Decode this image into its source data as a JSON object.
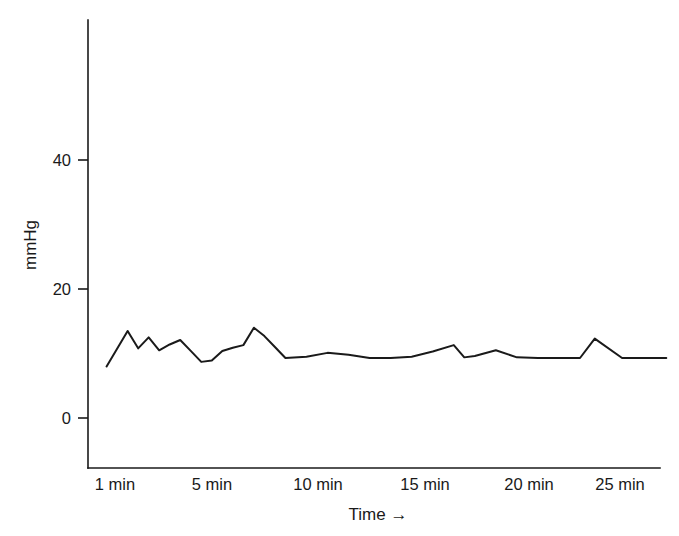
{
  "chart_data": {
    "type": "line",
    "title": "",
    "subtitle": "",
    "xlabel": "Time",
    "xlabel_display": "Time →",
    "ylabel": "mmHg",
    "grid": false,
    "legend": "none",
    "xlim": [
      0.3,
      27.5
    ],
    "ylim": [
      0,
      62
    ],
    "y_ticks": [
      0,
      20,
      40
    ],
    "y_tick_labels": [
      "0",
      "20",
      "40"
    ],
    "x_ticks": [
      1,
      5,
      10,
      15,
      20,
      25
    ],
    "x_tick_labels": [
      "1 min",
      "5 min",
      "10 min",
      "15 min",
      "20 min",
      "25 min"
    ],
    "series": [
      {
        "name": "pressure",
        "color": "#1a1a1a",
        "x": [
          0.6,
          1.6,
          2.1,
          2.6,
          3.1,
          3.6,
          4.1,
          4.6,
          5.1,
          5.6,
          6.1,
          6.6,
          7.1,
          7.6,
          8.1,
          8.6,
          9.1,
          10.1,
          11.1,
          12.1,
          13.1,
          14.1,
          15.1,
          16.1,
          17.1,
          17.6,
          18.1,
          19.1,
          20.1,
          21.1,
          22.1,
          23.1,
          23.8,
          25.1,
          26.1,
          27.2
        ],
        "y": [
          8.0,
          13.5,
          10.8,
          12.5,
          10.5,
          11.4,
          12.1,
          10.4,
          8.7,
          8.9,
          10.4,
          10.9,
          11.3,
          14.0,
          12.7,
          11.0,
          9.3,
          9.5,
          10.1,
          9.8,
          9.3,
          9.3,
          9.5,
          10.3,
          11.3,
          9.4,
          9.6,
          10.5,
          9.4,
          9.3,
          9.3,
          9.3,
          12.3,
          9.3,
          9.3,
          9.3
        ]
      }
    ]
  },
  "axes": {
    "y_axis_title": "mmHg",
    "x_axis_title": "Time",
    "x_axis_arrow": "→"
  }
}
